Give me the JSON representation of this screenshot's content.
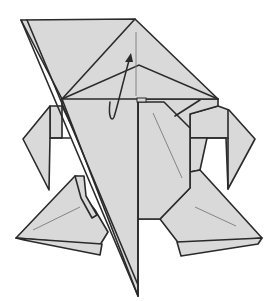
{
  "figure": {
    "type": "origami-folding-diagram",
    "colors": {
      "paper": "#d9d9d9",
      "line": "#2a2a2a",
      "crease": "#7a7a7a",
      "background": "#ffffff"
    },
    "symbols": [
      {
        "name": "fold-up-arrow",
        "description": "curved arrow indicating flap folded upward"
      },
      {
        "name": "valley-crease",
        "description": "thin crease lines on legs and body"
      }
    ]
  }
}
